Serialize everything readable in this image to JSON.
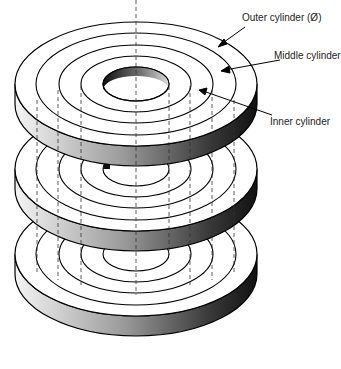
{
  "diagram": {
    "type": "concentric cylinder stack",
    "disc_count": 3,
    "labels": [
      {
        "id": "outer",
        "text": "Outer cylinder (Ø)"
      },
      {
        "id": "middle",
        "text": "Middle cylinder"
      },
      {
        "id": "inner",
        "text": "Inner cylinder"
      }
    ]
  }
}
